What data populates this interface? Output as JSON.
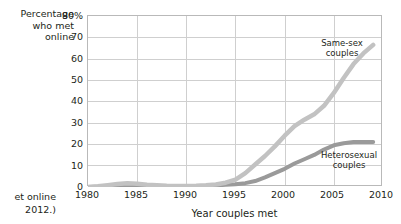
{
  "chart_data": {
    "type": "line",
    "title": "",
    "xlabel": "Year couples met",
    "ylabel": "Percentage who met online",
    "xlim": [
      1980,
      2010
    ],
    "ylim": [
      0,
      80
    ],
    "grid": true,
    "legend_position": "inline-annotations",
    "x_ticks": [
      "1980",
      "1985",
      "1990",
      "1995",
      "2000",
      "2005",
      "2010"
    ],
    "y_ticks": [
      "0",
      "10",
      "20",
      "30",
      "40",
      "50",
      "60",
      "70",
      "80%"
    ],
    "x": [
      1980,
      1981,
      1982,
      1983,
      1984,
      1985,
      1986,
      1987,
      1988,
      1989,
      1990,
      1991,
      1992,
      1993,
      1994,
      1995,
      1996,
      1997,
      1998,
      1999,
      2000,
      2001,
      2002,
      2003,
      2004,
      2005,
      2006,
      2007,
      2008,
      2009
    ],
    "series": [
      {
        "name": "Same-sex couples",
        "color": "#c2c2c2",
        "values": [
          0,
          0.3,
          0.8,
          1.4,
          1.7,
          1.5,
          1.1,
          0.8,
          0.6,
          0.5,
          0.5,
          0.6,
          0.8,
          1.2,
          2.0,
          3.5,
          6.5,
          10.5,
          14.5,
          19.0,
          24.0,
          28.5,
          31.5,
          34.0,
          38.0,
          44.0,
          51.0,
          57.5,
          62.5,
          66.5
        ]
      },
      {
        "name": "Heterosexual couples",
        "color": "#9a9a9a",
        "values": [
          0,
          0.1,
          0.2,
          0.3,
          0.4,
          0.4,
          0.4,
          0.4,
          0.4,
          0.4,
          0.5,
          0.5,
          0.6,
          0.8,
          1.0,
          1.3,
          1.8,
          2.8,
          4.5,
          6.5,
          8.5,
          11.0,
          13.0,
          15.0,
          17.5,
          19.5,
          20.5,
          21.0,
          21.0,
          21.0
        ]
      }
    ]
  },
  "axis": {
    "y_caption_line1": "Percentage",
    "y_caption_line2": "who met",
    "y_caption_line3": "online",
    "x_title": "Year couples met"
  },
  "annotations": {
    "samesex_line1": "Same-sex",
    "samesex_line2": "couples",
    "hetero_line1": "Heterosexual",
    "hetero_line2": "couples"
  },
  "source_note": {
    "line1": "et online",
    "line2": "2012.)"
  },
  "colors": {
    "samesex": "#c2c2c2",
    "heterosexual": "#9a9a9a",
    "grid": "#cfcfcf",
    "frame": "#b9b9b9",
    "text": "#231f20"
  }
}
